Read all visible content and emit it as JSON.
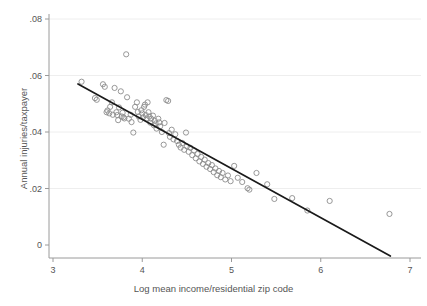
{
  "chart_data": {
    "type": "scatter",
    "title": "",
    "xlabel": "Log mean income/residential zip code",
    "ylabel": "Annual injuries/taxpayer",
    "xlim": [
      3,
      7
    ],
    "ylim": [
      -0.006,
      0.082
    ],
    "xticks": [
      3,
      4,
      5,
      6,
      7
    ],
    "xtick_labels": [
      "3",
      "4",
      "5",
      "6",
      "7"
    ],
    "yticks": [
      0,
      0.02,
      0.04,
      0.06,
      0.08
    ],
    "ytick_labels": [
      "0",
      ".02",
      ".04",
      ".06",
      ".08"
    ],
    "grid": "horizontal",
    "legend": "none",
    "marker": "open-circle",
    "marker_color": "#8c8c8c",
    "line_color": "#1a1a1a",
    "axis_color": "#9a9a9a",
    "grid_color": "#eeeeee",
    "fit_line": {
      "label": "linear fit",
      "x0": 3.28,
      "y0": 0.057,
      "x1": 6.78,
      "y1": -0.0039,
      "slope": -0.0174,
      "intercept": 0.1141
    },
    "points": [
      [
        3.32,
        0.0578
      ],
      [
        3.47,
        0.052
      ],
      [
        3.49,
        0.0514
      ],
      [
        3.56,
        0.0569
      ],
      [
        3.58,
        0.056
      ],
      [
        3.6,
        0.047
      ],
      [
        3.61,
        0.0476
      ],
      [
        3.63,
        0.0466
      ],
      [
        3.64,
        0.0489
      ],
      [
        3.66,
        0.0505
      ],
      [
        3.67,
        0.0461
      ],
      [
        3.69,
        0.0556
      ],
      [
        3.71,
        0.047
      ],
      [
        3.72,
        0.046
      ],
      [
        3.73,
        0.0442
      ],
      [
        3.74,
        0.0487
      ],
      [
        3.76,
        0.0544
      ],
      [
        3.77,
        0.0455
      ],
      [
        3.78,
        0.0468
      ],
      [
        3.79,
        0.0452
      ],
      [
        3.8,
        0.0448
      ],
      [
        3.82,
        0.0675
      ],
      [
        3.83,
        0.0523
      ],
      [
        3.85,
        0.0447
      ],
      [
        3.87,
        0.0461
      ],
      [
        3.88,
        0.0435
      ],
      [
        3.9,
        0.0398
      ],
      [
        3.92,
        0.0489
      ],
      [
        3.94,
        0.0505
      ],
      [
        3.95,
        0.0471
      ],
      [
        3.96,
        0.0455
      ],
      [
        3.98,
        0.0443
      ],
      [
        3.99,
        0.0477
      ],
      [
        4.0,
        0.0466
      ],
      [
        4.01,
        0.0452
      ],
      [
        4.02,
        0.0489
      ],
      [
        4.03,
        0.0497
      ],
      [
        4.04,
        0.046
      ],
      [
        4.05,
        0.0448
      ],
      [
        4.06,
        0.0505
      ],
      [
        4.07,
        0.047
      ],
      [
        4.08,
        0.0455
      ],
      [
        4.09,
        0.0433
      ],
      [
        4.1,
        0.0447
      ],
      [
        4.12,
        0.0458
      ],
      [
        4.13,
        0.0424
      ],
      [
        4.14,
        0.044
      ],
      [
        4.15,
        0.043
      ],
      [
        4.16,
        0.0412
      ],
      [
        4.18,
        0.0447
      ],
      [
        4.19,
        0.0434
      ],
      [
        4.2,
        0.042
      ],
      [
        4.22,
        0.04
      ],
      [
        4.24,
        0.0355
      ],
      [
        4.25,
        0.0432
      ],
      [
        4.27,
        0.0513
      ],
      [
        4.29,
        0.051
      ],
      [
        4.3,
        0.0396
      ],
      [
        4.31,
        0.0383
      ],
      [
        4.33,
        0.0408
      ],
      [
        4.35,
        0.0374
      ],
      [
        4.37,
        0.0392
      ],
      [
        4.39,
        0.0368
      ],
      [
        4.41,
        0.0355
      ],
      [
        4.43,
        0.0345
      ],
      [
        4.45,
        0.0361
      ],
      [
        4.47,
        0.0337
      ],
      [
        4.49,
        0.0398
      ],
      [
        4.5,
        0.0349
      ],
      [
        4.52,
        0.033
      ],
      [
        4.54,
        0.0344
      ],
      [
        4.56,
        0.0318
      ],
      [
        4.58,
        0.0335
      ],
      [
        4.6,
        0.0307
      ],
      [
        4.62,
        0.0322
      ],
      [
        4.64,
        0.0296
      ],
      [
        4.66,
        0.0312
      ],
      [
        4.68,
        0.0287
      ],
      [
        4.7,
        0.0302
      ],
      [
        4.72,
        0.0277
      ],
      [
        4.74,
        0.029
      ],
      [
        4.76,
        0.0269
      ],
      [
        4.78,
        0.0283
      ],
      [
        4.8,
        0.0258
      ],
      [
        4.82,
        0.0271
      ],
      [
        4.84,
        0.0247
      ],
      [
        4.86,
        0.0262
      ],
      [
        4.88,
        0.024
      ],
      [
        4.9,
        0.0255
      ],
      [
        4.93,
        0.0232
      ],
      [
        4.96,
        0.0246
      ],
      [
        4.99,
        0.0226
      ],
      [
        5.03,
        0.028
      ],
      [
        5.07,
        0.0238
      ],
      [
        5.12,
        0.0223
      ],
      [
        5.18,
        0.0201
      ],
      [
        5.2,
        0.0196
      ],
      [
        5.28,
        0.0255
      ],
      [
        5.4,
        0.0215
      ],
      [
        5.48,
        0.0163
      ],
      [
        5.68,
        0.0166
      ],
      [
        5.85,
        0.0122
      ],
      [
        6.1,
        0.0156
      ],
      [
        6.77,
        0.011
      ]
    ]
  }
}
